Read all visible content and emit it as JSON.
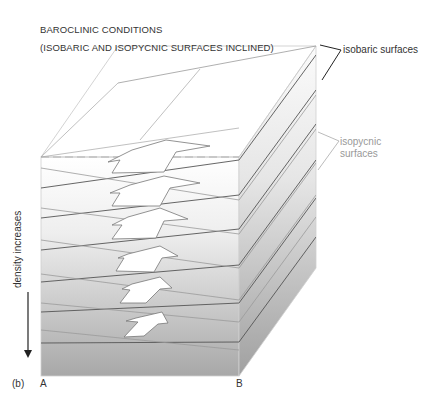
{
  "title": {
    "line1": "BAROCLINIC CONDITIONS",
    "line2": "(ISOBARIC AND ISOPYCNIC SURFACES INCLINED)"
  },
  "labels": {
    "isobaric": "isobaric surfaces",
    "isopycnic": "isopycnic surfaces",
    "density": "density increases",
    "panel": "(b)",
    "corner_a": "A",
    "corner_b": "B"
  },
  "colors": {
    "top_shade": "#ffffff",
    "bottom_shade": "#a8a8a8",
    "isobaric_line": "#555555",
    "isopycnic_line": "#9a9a9a",
    "arrow_fill": "#ffffff"
  },
  "diagram": {
    "arrows_count": 6,
    "isobaric_surfaces": 6,
    "isopycnic_surfaces": 6
  }
}
